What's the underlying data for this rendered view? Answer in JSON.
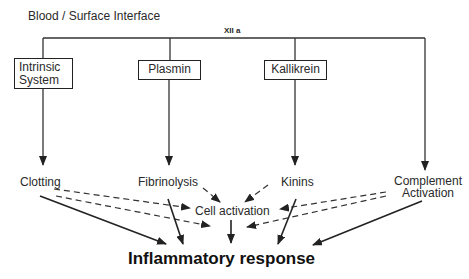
{
  "diagram": {
    "title": "Blood / Surface Interface",
    "factor_label": "XII a",
    "boxes": [
      {
        "id": "intrinsic",
        "line1": "Intrinsic",
        "line2": "System"
      },
      {
        "id": "plasmin",
        "label": "Plasmin"
      },
      {
        "id": "kallikrein",
        "label": "Kallikrein"
      }
    ],
    "outcomes": {
      "clotting": "Clotting",
      "fibrinolysis": "Fibrinolysis",
      "kinins": "Kinins",
      "complement_line1": "Complement",
      "complement_line2": "Activation"
    },
    "cell_activation": "Cell activation",
    "final": "Inflammatory response",
    "edges": [
      {
        "from": "XII a",
        "to": "Intrinsic System",
        "style": "solid"
      },
      {
        "from": "XII a",
        "to": "Plasmin",
        "style": "solid"
      },
      {
        "from": "XII a",
        "to": "Kallikrein",
        "style": "solid"
      },
      {
        "from": "XII a",
        "to": "Complement Activation",
        "style": "solid"
      },
      {
        "from": "Intrinsic System",
        "to": "Clotting",
        "style": "solid"
      },
      {
        "from": "Plasmin",
        "to": "Fibrinolysis",
        "style": "solid"
      },
      {
        "from": "Kallikrein",
        "to": "Kinins",
        "style": "solid"
      },
      {
        "from": "Clotting",
        "to": "Cell activation",
        "style": "dashed"
      },
      {
        "from": "Fibrinolysis",
        "to": "Cell activation",
        "style": "dashed"
      },
      {
        "from": "Kinins",
        "to": "Cell activation",
        "style": "dashed"
      },
      {
        "from": "Complement Activation",
        "to": "Cell activation",
        "style": "dashed"
      },
      {
        "from": "Clotting",
        "to": "Inflammatory response",
        "style": "solid"
      },
      {
        "from": "Fibrinolysis",
        "to": "Inflammatory response",
        "style": "solid"
      },
      {
        "from": "Kinins",
        "to": "Inflammatory response",
        "style": "solid"
      },
      {
        "from": "Complement Activation",
        "to": "Inflammatory response",
        "style": "solid"
      },
      {
        "from": "Cell activation",
        "to": "Inflammatory response",
        "style": "solid"
      }
    ]
  }
}
